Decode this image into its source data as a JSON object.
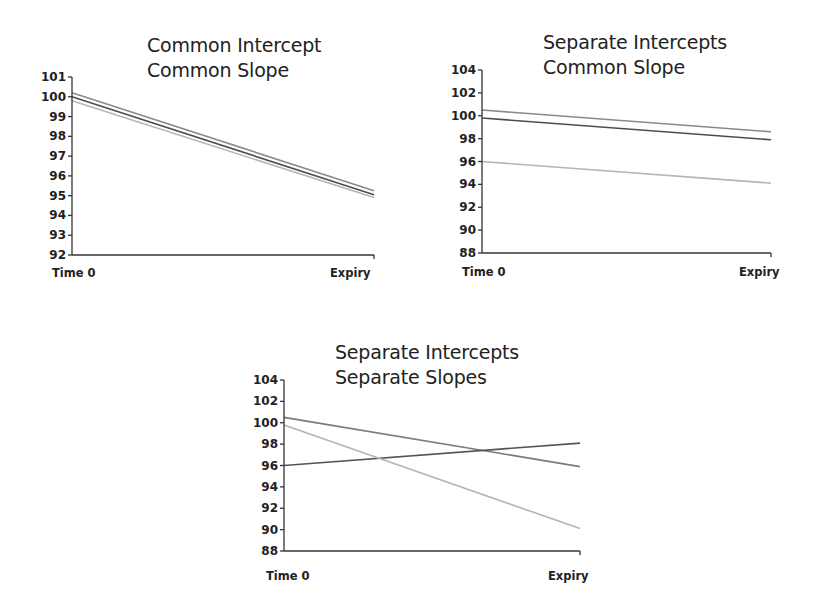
{
  "chart_data": [
    {
      "type": "line",
      "title": "Common Intercept\nCommon Slope",
      "title_lines": [
        "Common Intercept",
        "Common Slope"
      ],
      "xlabel": "",
      "ylabel": "",
      "categories": [
        "Time 0",
        "Expiry"
      ],
      "ylim": [
        92,
        101
      ],
      "yticks": [
        101,
        100,
        99,
        98,
        97,
        96,
        95,
        94,
        93,
        92
      ],
      "grid": false,
      "legend": null,
      "series": [
        {
          "name": "Batch A",
          "values": [
            100.2,
            95.25
          ],
          "color": "#8a8a8a"
        },
        {
          "name": "Batch B",
          "values": [
            100.0,
            95.05
          ],
          "color": "#4d4d4d"
        },
        {
          "name": "Batch C",
          "values": [
            99.8,
            94.9
          ],
          "color": "#b5b5b5"
        }
      ]
    },
    {
      "type": "line",
      "title": "Separate Intercepts\nCommon Slope",
      "title_lines": [
        "Separate Intercepts",
        "Common Slope"
      ],
      "xlabel": "",
      "ylabel": "",
      "categories": [
        "Time 0",
        "Expiry"
      ],
      "ylim": [
        88,
        104
      ],
      "yticks": [
        104,
        102,
        100,
        98,
        96,
        94,
        92,
        90,
        88
      ],
      "grid": false,
      "legend": null,
      "series": [
        {
          "name": "Batch A",
          "values": [
            100.5,
            98.6
          ],
          "color": "#8a8a8a"
        },
        {
          "name": "Batch B",
          "values": [
            99.8,
            97.9
          ],
          "color": "#4d4d4d"
        },
        {
          "name": "Batch C",
          "values": [
            96.0,
            94.1
          ],
          "color": "#b5b5b5"
        }
      ]
    },
    {
      "type": "line",
      "title": "Separate Intercepts\nSeparate Slopes",
      "title_lines": [
        "Separate Intercepts",
        "Separate Slopes"
      ],
      "xlabel": "",
      "ylabel": "",
      "categories": [
        "Time 0",
        "Expiry"
      ],
      "ylim": [
        88,
        104
      ],
      "yticks": [
        104,
        102,
        100,
        98,
        96,
        94,
        92,
        90,
        88
      ],
      "grid": false,
      "legend": null,
      "series": [
        {
          "name": "Batch A",
          "values": [
            100.5,
            95.9
          ],
          "color": "#7a7a7a"
        },
        {
          "name": "Batch B",
          "values": [
            96.0,
            98.1
          ],
          "color": "#555555"
        },
        {
          "name": "Batch C",
          "values": [
            99.8,
            90.1
          ],
          "color": "#b5b5b5"
        }
      ]
    }
  ],
  "axis_color": "#333333"
}
